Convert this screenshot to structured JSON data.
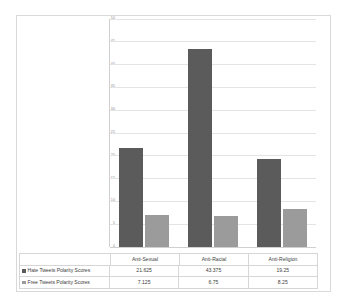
{
  "chart_data": {
    "type": "bar",
    "title": "",
    "xlabel": "",
    "ylabel": "",
    "ylim": [
      0,
      50
    ],
    "ytick_step": 5,
    "yticks": [
      "0",
      "5",
      "10",
      "15",
      "20",
      "25",
      "30",
      "35",
      "40",
      "45",
      "50"
    ],
    "grid": true,
    "legend_position": "data-table-left",
    "categories": [
      "Anti-Sexual",
      "Anti-Racial",
      "Anti-Religion"
    ],
    "series": [
      {
        "name": "Hate Tweets Polarity Scores",
        "color": "#5b5b5b",
        "values": [
          21.625,
          43.375,
          19.25
        ],
        "value_labels": [
          "21.625",
          "43.375",
          "19.25"
        ]
      },
      {
        "name": "Free Tweets Polarity Scores",
        "color": "#9b9b9b",
        "values": [
          7.125,
          6.75,
          8.25
        ],
        "value_labels": [
          "7.125",
          "6.75",
          "8.25"
        ]
      }
    ]
  }
}
